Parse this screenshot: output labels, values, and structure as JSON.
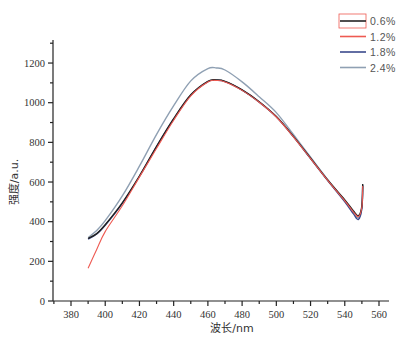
{
  "chart_data": {
    "type": "line",
    "title": "",
    "xlabel": "波长/nm",
    "ylabel": "强度/a.u.",
    "xlim": [
      370,
      570
    ],
    "ylim": [
      0,
      1300
    ],
    "xticks": [
      380,
      400,
      420,
      440,
      460,
      480,
      500,
      520,
      540,
      560
    ],
    "yticks": [
      0,
      200,
      400,
      600,
      800,
      1000,
      1200
    ],
    "grid": false,
    "legend_position": "top-right",
    "series": [
      {
        "name": "0.6%",
        "color": "#222222",
        "x": [
          390,
          395,
          400,
          410,
          420,
          430,
          440,
          450,
          460,
          465,
          470,
          480,
          490,
          500,
          510,
          520,
          530,
          540,
          545,
          548,
          550,
          550.5
        ],
        "y": [
          315,
          340,
          385,
          495,
          630,
          780,
          920,
          1040,
          1108,
          1115,
          1108,
          1065,
          1005,
          930,
          830,
          720,
          610,
          510,
          455,
          430,
          480,
          590
        ]
      },
      {
        "name": "1.2%",
        "color": "#ee5a52",
        "x": [
          390,
          395,
          400,
          410,
          420,
          430,
          440,
          450,
          460,
          465,
          470,
          480,
          490,
          500,
          510,
          520,
          530,
          540,
          545,
          548,
          550,
          550.5
        ],
        "y": [
          165,
          260,
          350,
          480,
          625,
          770,
          912,
          1035,
          1105,
          1112,
          1105,
          1062,
          1002,
          928,
          828,
          718,
          608,
          505,
          450,
          425,
          475,
          580
        ]
      },
      {
        "name": "1.8%",
        "color": "#3a4a8c",
        "x": [
          390,
          395,
          400,
          410,
          420,
          430,
          440,
          450,
          460,
          465,
          470,
          480,
          490,
          500,
          510,
          520,
          530,
          540,
          545,
          548,
          550,
          550.5
        ],
        "y": [
          312,
          338,
          382,
          492,
          628,
          778,
          918,
          1038,
          1106,
          1113,
          1106,
          1063,
          1003,
          929,
          829,
          718,
          607,
          500,
          440,
          412,
          470,
          585
        ]
      },
      {
        "name": "2.4%",
        "color": "#8fa0b3",
        "x": [
          390,
          395,
          400,
          410,
          420,
          430,
          440,
          450,
          460,
          465,
          470,
          480,
          490,
          500,
          510,
          520,
          530,
          540,
          545,
          548,
          550,
          550.5
        ],
        "y": [
          320,
          355,
          405,
          530,
          680,
          840,
          985,
          1110,
          1172,
          1175,
          1165,
          1105,
          1030,
          950,
          840,
          725,
          612,
          505,
          450,
          420,
          470,
          580
        ]
      }
    ]
  }
}
